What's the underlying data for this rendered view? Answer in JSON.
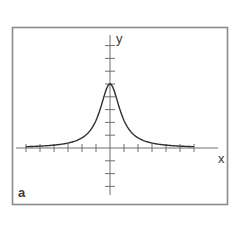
{
  "chart_data": {
    "type": "line",
    "title": "",
    "panel_label": "a",
    "xlabel": "x",
    "ylabel": "y",
    "function": "y = 5 / (1 + (x/0.87)^2)",
    "xlim": [
      -6.5,
      7.7
    ],
    "ylim": [
      -3.6,
      8.9
    ],
    "x_ticks": [
      -6,
      -5,
      -4,
      -3,
      -2,
      -1,
      1,
      2,
      3,
      4,
      5,
      6
    ],
    "y_ticks": [
      -3,
      -2,
      -1,
      1,
      2,
      3,
      4,
      5,
      6,
      7,
      8
    ],
    "tick_labels_shown": false,
    "grid": false,
    "series": [
      {
        "name": "curve",
        "x": [
          -6,
          -5,
          -4,
          -3,
          -2,
          -1.5,
          -1,
          -0.75,
          -0.5,
          -0.25,
          0,
          0.25,
          0.5,
          0.75,
          1,
          1.5,
          2,
          3,
          4,
          5,
          6
        ],
        "values": [
          0.1,
          0.15,
          0.23,
          0.39,
          0.8,
          1.26,
          2.16,
          2.87,
          3.76,
          4.62,
          5.0,
          4.62,
          3.76,
          2.87,
          2.16,
          1.26,
          0.8,
          0.39,
          0.23,
          0.15,
          0.1
        ]
      }
    ],
    "peak": {
      "x": 0,
      "y": 5
    },
    "colors": {
      "curve": "#2e2e2e",
      "axes": "#6f6f6f",
      "frame": "#8a8a8a"
    }
  },
  "labels": {
    "x_axis": "x",
    "y_axis": "y",
    "panel": "a"
  }
}
